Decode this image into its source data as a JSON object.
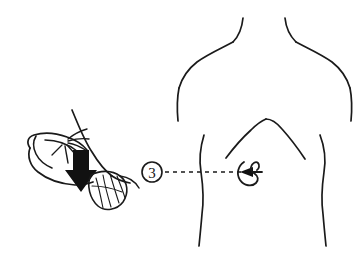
{
  "illustration": {
    "title": "Percussion over kidney area — posterior torso",
    "style": "black-and-white line drawing",
    "background_color": "#ffffff",
    "ink_color": "#1a1a1a",
    "fill_color": "#111111"
  },
  "callout": {
    "step_number": "3",
    "marker_shape": "circle",
    "leader_line_style": "dashed",
    "leader_arrow_direction": "left",
    "marker_name": "step-3-marker"
  },
  "left_panel": {
    "name": "percussion-hand-illustration",
    "description": "Forearm with sleeve cuff, splayed fingers, solid downward arrow striking a hatched hand/leaf form",
    "parts": [
      {
        "name": "forearm-sleeve",
        "label": "Forearm with sleeve cuff"
      },
      {
        "name": "fingers",
        "label": "Splayed fingers"
      },
      {
        "name": "down-arrow",
        "label": "Downward striking arrow"
      },
      {
        "name": "hatched-hand",
        "label": "Flat hand with hatched lines"
      }
    ]
  },
  "right_panel": {
    "name": "posterior-torso-illustration",
    "description": "Outline of a human back showing neck, shoulders, scapular lines, waist and kidney landmark",
    "parts": [
      {
        "name": "neck-outline",
        "label": "Neck"
      },
      {
        "name": "shoulder-left",
        "label": "Left shoulder"
      },
      {
        "name": "shoulder-right",
        "label": "Right shoulder"
      },
      {
        "name": "torso-side-left",
        "label": "Left torso side"
      },
      {
        "name": "torso-side-right",
        "label": "Right torso side"
      },
      {
        "name": "scapular-line-left",
        "label": "Left scapular / lat line"
      },
      {
        "name": "scapular-line-right",
        "label": "Right scapular / lat line"
      },
      {
        "name": "kidney-landmark",
        "label": "Kidney landmark"
      }
    ]
  }
}
